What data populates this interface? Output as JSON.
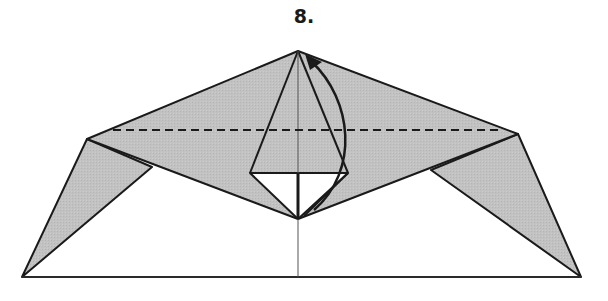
{
  "diagram": {
    "type": "origami-fold-step",
    "step_label": "8.",
    "colors": {
      "paper_colored_side": "#c0c0c0",
      "paper_white_side": "#ffffff",
      "line": "#1a1a1a",
      "center_line": "#555555"
    },
    "elements": {
      "valley_fold_line": "dashed horizontal fold line",
      "fold_arrow": "curved arrow from bottom point up to top apex"
    }
  }
}
